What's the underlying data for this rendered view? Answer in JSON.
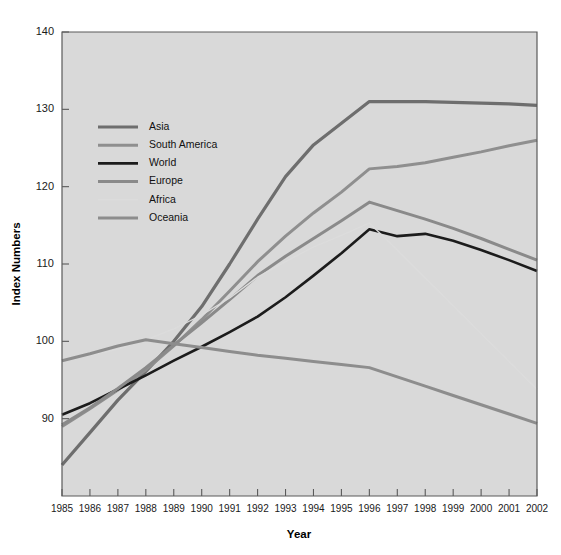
{
  "chart_data": {
    "type": "line",
    "title": "",
    "xlabel": "Year",
    "ylabel": "Index Numbers",
    "xlim": [
      1985,
      2002
    ],
    "ylim": [
      80,
      140
    ],
    "yticks": [
      90,
      100,
      110,
      120,
      130,
      140
    ],
    "ytick_labels": [
      "90",
      "100",
      "110",
      "120",
      "130",
      "140"
    ],
    "x": [
      1985,
      1986,
      1987,
      1988,
      1989,
      1990,
      1991,
      1992,
      1993,
      1994,
      1995,
      1996,
      1997,
      1998,
      1999,
      2000,
      2001,
      2002
    ],
    "xtick_labels": [
      "1985",
      "1986",
      "1987",
      "1988",
      "1989",
      "1990",
      "1991",
      "1992",
      "1993",
      "1994",
      "1995",
      "1996",
      "1997",
      "1998",
      "1999",
      "2000",
      "2001",
      "2002"
    ],
    "grid": false,
    "legend_position": "upper-left-inside",
    "plot_background": "#d9d9d9",
    "series": [
      {
        "name": "Asia",
        "color": "#6e6e6e",
        "width": 3.2,
        "values": [
          84.0,
          88.2,
          92.4,
          96.1,
          100.0,
          104.5,
          110.0,
          115.8,
          121.3,
          125.4,
          128.2,
          131.0,
          131.0,
          131.0,
          130.9,
          130.8,
          130.7,
          130.5
        ]
      },
      {
        "name": "South America",
        "color": "#8f8f8f",
        "width": 3.0,
        "values": [
          89.0,
          91.3,
          93.7,
          96.3,
          99.4,
          102.8,
          106.5,
          110.3,
          113.6,
          116.6,
          119.3,
          122.3,
          122.6,
          123.1,
          123.8,
          124.5,
          125.3,
          126.0
        ]
      },
      {
        "name": "World",
        "color": "#1c1c1c",
        "width": 2.6,
        "values": [
          90.5,
          92.0,
          93.8,
          95.6,
          97.5,
          99.3,
          101.2,
          103.2,
          105.7,
          108.5,
          111.4,
          114.5,
          113.6,
          113.9,
          113.0,
          111.8,
          110.5,
          109.1
        ]
      },
      {
        "name": "Europe",
        "color": "#8a8a8a",
        "width": 3.0,
        "values": [
          89.2,
          91.4,
          93.9,
          96.6,
          99.5,
          102.4,
          105.4,
          108.5,
          111.0,
          113.3,
          115.6,
          118.0,
          116.9,
          115.8,
          114.6,
          113.3,
          111.9,
          110.5
        ]
      },
      {
        "name": "Africa",
        "color": "#dcdcdc",
        "width": 1.3,
        "values": [
          97.6,
          98.2,
          99.0,
          100.2,
          101.6,
          103.4,
          105.6,
          108.3,
          110.3,
          112.2,
          113.7,
          115.3,
          111.8,
          108.2,
          104.6,
          101.0,
          97.4,
          93.8
        ]
      },
      {
        "name": "Oceania",
        "color": "#8d8d8d",
        "width": 3.0,
        "values": [
          97.5,
          98.4,
          99.4,
          100.2,
          99.7,
          99.2,
          98.7,
          98.2,
          97.8,
          97.4,
          97.0,
          96.6,
          95.4,
          94.2,
          93.0,
          91.8,
          90.6,
          89.4
        ]
      }
    ],
    "legend": [
      {
        "label": "Asia",
        "color": "#6e6e6e"
      },
      {
        "label": "South America",
        "color": "#8f8f8f"
      },
      {
        "label": "World",
        "color": "#1c1c1c"
      },
      {
        "label": "Europe",
        "color": "#8a8a8a"
      },
      {
        "label": "Africa",
        "color": "#dcdcdc"
      },
      {
        "label": "Oceania",
        "color": "#8d8d8d"
      }
    ]
  }
}
